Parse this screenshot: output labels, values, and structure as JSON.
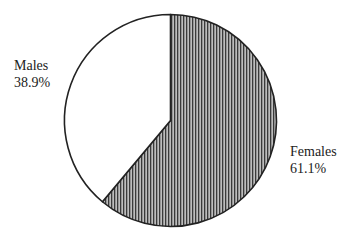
{
  "chart_data": {
    "type": "pie",
    "title": "",
    "labels": [
      "Females",
      "Males"
    ],
    "values": [
      61.1,
      38.9
    ],
    "value_labels": [
      "61.1%",
      "38.9%"
    ],
    "start_angle_deg": 0,
    "direction": "clockwise",
    "fills": [
      "vertical-hatch",
      "white"
    ],
    "legend": "none",
    "annotations": [
      {
        "text": "Females",
        "pct": "61.1%",
        "position": "right"
      },
      {
        "text": "Males",
        "pct": "38.9%",
        "position": "upper-left"
      }
    ]
  },
  "colors": {
    "outline": "#222222",
    "hatch_dark": "#444444",
    "hatch_light": "#bbbbbb",
    "background": "#ffffff"
  },
  "labels": {
    "males": {
      "name": "Males",
      "pct": "38.9%"
    },
    "females": {
      "name": "Females",
      "pct": "61.1%"
    }
  }
}
